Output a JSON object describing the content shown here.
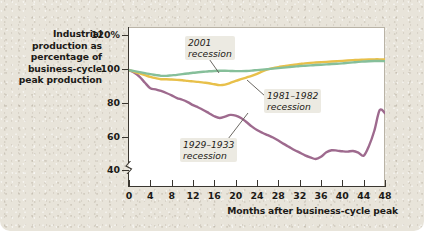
{
  "figure": {
    "y_axis_title": [
      "Industrial",
      "production as",
      "percentage of",
      "business-cycle",
      "peak production"
    ],
    "x_axis_title": "Months after business-cycle peak",
    "panel_color": "#e8e4da",
    "plot_background": "#ffffff"
  },
  "annotations": {
    "a2001": [
      "2001",
      "recession"
    ],
    "a1981": [
      "1981–1982",
      "recession"
    ],
    "a1929": [
      "1929–1933",
      "recession"
    ]
  },
  "chart_data": {
    "type": "line",
    "title": "",
    "subtitle": "",
    "xlabel": "Months after business-cycle peak",
    "ylabel": "Industrial production as percentage of business-cycle peak production",
    "xlim": [
      0,
      48
    ],
    "ylim": [
      30,
      125
    ],
    "y_axis_break": true,
    "grid": false,
    "legend_position": "inline-annotations",
    "xticks": [
      0,
      4,
      8,
      12,
      16,
      20,
      24,
      28,
      32,
      36,
      40,
      44,
      48
    ],
    "xtick_labels": [
      "0",
      "4",
      "8",
      "12",
      "16",
      "20",
      "24",
      "28",
      "32",
      "36",
      "40",
      "44",
      "48"
    ],
    "yticks": [
      40,
      60,
      80,
      100,
      120
    ],
    "ytick_labels": [
      "40",
      "60",
      "80",
      "100",
      "120%"
    ],
    "x": [
      0,
      1,
      2,
      3,
      4,
      5,
      6,
      7,
      8,
      9,
      10,
      11,
      12,
      13,
      14,
      15,
      16,
      17,
      18,
      19,
      20,
      21,
      22,
      23,
      24,
      25,
      26,
      27,
      28,
      29,
      30,
      31,
      32,
      33,
      34,
      35,
      36,
      37,
      38,
      39,
      40,
      41,
      42,
      43,
      44,
      45,
      46,
      47,
      48
    ],
    "series": [
      {
        "name": "2001 recession",
        "color": "#86bf9a",
        "values": [
          100,
          99.4,
          98.8,
          98.2,
          97.6,
          97.1,
          96.6,
          96.6,
          96.9,
          97.2,
          97.6,
          98.0,
          98.4,
          98.7,
          99.0,
          99.3,
          99.5,
          99.6,
          99.6,
          99.5,
          99.4,
          99.4,
          99.5,
          99.7,
          100.0,
          100.3,
          100.6,
          100.9,
          101.2,
          101.5,
          101.8,
          102.1,
          102.4,
          102.6,
          102.8,
          103.0,
          103.2,
          103.4,
          103.6,
          103.8,
          104.0,
          104.3,
          104.6,
          104.9,
          105.1,
          105.3,
          105.4,
          105.4,
          105.3
        ]
      },
      {
        "name": "1981–1982 recession",
        "color": "#e8c04a",
        "values": [
          100,
          99.0,
          98.0,
          97.0,
          96.0,
          95.2,
          94.6,
          94.6,
          94.4,
          94.2,
          94.0,
          93.6,
          93.3,
          93.0,
          92.6,
          92.2,
          91.6,
          91.1,
          91.4,
          92.4,
          93.6,
          94.6,
          95.6,
          96.6,
          97.8,
          99.2,
          100.4,
          101.2,
          101.8,
          102.3,
          102.8,
          103.2,
          103.6,
          104.0,
          104.3,
          104.5,
          104.7,
          104.9,
          105.1,
          105.3,
          105.5,
          105.7,
          105.9,
          106.1,
          106.2,
          106.3,
          106.4,
          106.4,
          106.3
        ]
      },
      {
        "name": "1929–1933 recession",
        "color": "#9e6a8e",
        "values": [
          100,
          98.5,
          96.0,
          92.5,
          89.2,
          88.6,
          87.6,
          86.4,
          85.0,
          83.4,
          82.4,
          81.0,
          79.2,
          77.8,
          76.2,
          74.4,
          72.6,
          71.6,
          72.4,
          73.4,
          73.0,
          71.6,
          69.2,
          66.6,
          64.4,
          62.8,
          61.4,
          60.0,
          58.2,
          56.2,
          54.4,
          52.6,
          51.0,
          49.4,
          48.2,
          47.2,
          48.6,
          51.2,
          52.4,
          52.2,
          51.8,
          51.6,
          52.0,
          51.0,
          49.2,
          55.0,
          64.0,
          76.2,
          74.4
        ]
      }
    ]
  }
}
